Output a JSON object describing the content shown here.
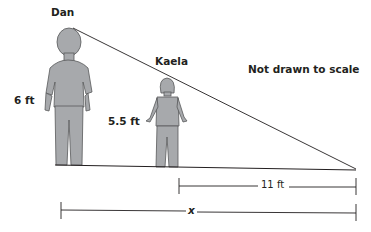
{
  "diagram": {
    "people": [
      {
        "name": "Dan",
        "height_label": "6 ft"
      },
      {
        "name": "Kaela",
        "height_label": "5.5 ft"
      }
    ],
    "note": "Not drawn to scale",
    "measurements": {
      "shadow_segment": "11 ft",
      "total_segment": "x"
    },
    "colors": {
      "figure_fill": "#a7a9ac",
      "line": "#231f20"
    }
  }
}
